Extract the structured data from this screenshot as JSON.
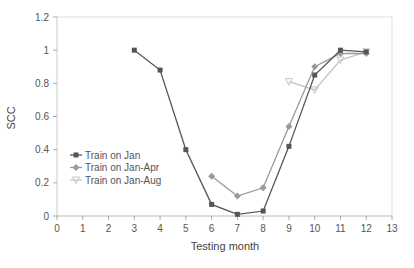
{
  "chart_data": {
    "type": "line",
    "title": "",
    "xlabel": "Testing month",
    "ylabel": "SCC",
    "xlim": [
      0,
      13
    ],
    "ylim": [
      0,
      1.2
    ],
    "xticks": [
      0,
      1,
      2,
      3,
      4,
      5,
      6,
      7,
      8,
      9,
      10,
      11,
      12,
      13
    ],
    "yticks": [
      0,
      0.2,
      0.4,
      0.6,
      0.8,
      1,
      1.2
    ],
    "ytick_labels": [
      "0",
      "0.2",
      "0.4",
      "0.6",
      "0.8",
      "1",
      "1.2"
    ],
    "grid": false,
    "legend_position": "left-center inside plot",
    "series": [
      {
        "name": "Train on Jan",
        "marker": "square",
        "color": "#555555",
        "x": [
          3,
          4,
          5,
          6,
          7,
          8,
          9,
          10,
          11,
          12
        ],
        "values": [
          1.0,
          0.88,
          0.4,
          0.07,
          0.01,
          0.03,
          0.42,
          0.85,
          1.0,
          0.99
        ]
      },
      {
        "name": "Train on Jan-Apr",
        "marker": "diamond",
        "color": "#9a9a9a",
        "x": [
          6,
          7,
          8,
          9,
          10,
          11,
          12
        ],
        "values": [
          0.24,
          0.12,
          0.17,
          0.54,
          0.9,
          0.98,
          0.98
        ]
      },
      {
        "name": "Train on Jan-Aug",
        "marker": "triangle-down",
        "color": "#c4c4c4",
        "x": [
          9,
          10,
          11,
          12
        ],
        "values": [
          0.81,
          0.76,
          0.94,
          0.99
        ]
      }
    ]
  }
}
